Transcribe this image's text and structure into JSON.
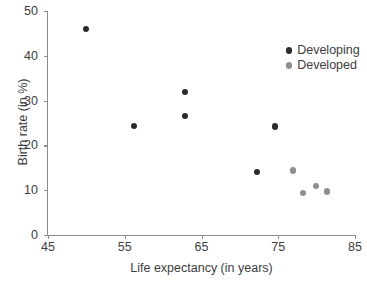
{
  "chart_data": {
    "type": "scatter",
    "title": "",
    "xlabel": "Life expectancy (in years)",
    "ylabel": "Birth rate (in %)",
    "xlim": [
      45,
      85
    ],
    "ylim": [
      0,
      50
    ],
    "xticks": [
      45,
      55,
      65,
      75,
      85
    ],
    "yticks": [
      0,
      10,
      20,
      30,
      40,
      50
    ],
    "grid": false,
    "legend_position": "top-right",
    "series": [
      {
        "name": "Developing",
        "color": "#2b2b2b",
        "points": [
          {
            "x": 50.0,
            "y": 46.0
          },
          {
            "x": 56.2,
            "y": 24.3
          },
          {
            "x": 62.8,
            "y": 32.0
          },
          {
            "x": 62.8,
            "y": 26.5
          },
          {
            "x": 72.2,
            "y": 14.0
          },
          {
            "x": 74.6,
            "y": 24.2
          }
        ]
      },
      {
        "name": "Developed",
        "color": "#8f8f8f",
        "points": [
          {
            "x": 76.9,
            "y": 14.4
          },
          {
            "x": 78.2,
            "y": 9.4
          },
          {
            "x": 79.9,
            "y": 11.0
          },
          {
            "x": 81.3,
            "y": 9.7
          }
        ]
      }
    ]
  },
  "legend": {
    "entries": [
      {
        "label": "Developing",
        "color": "#2b2b2b"
      },
      {
        "label": "Developed",
        "color": "#8f8f8f"
      }
    ]
  },
  "axes": {
    "x_tick_labels": [
      "45",
      "55",
      "65",
      "75",
      "85"
    ],
    "y_tick_labels": [
      "0",
      "10",
      "20",
      "30",
      "40",
      "50"
    ],
    "x_title": "Life expectancy (in years)",
    "y_title": "Birth rate (in %)"
  }
}
